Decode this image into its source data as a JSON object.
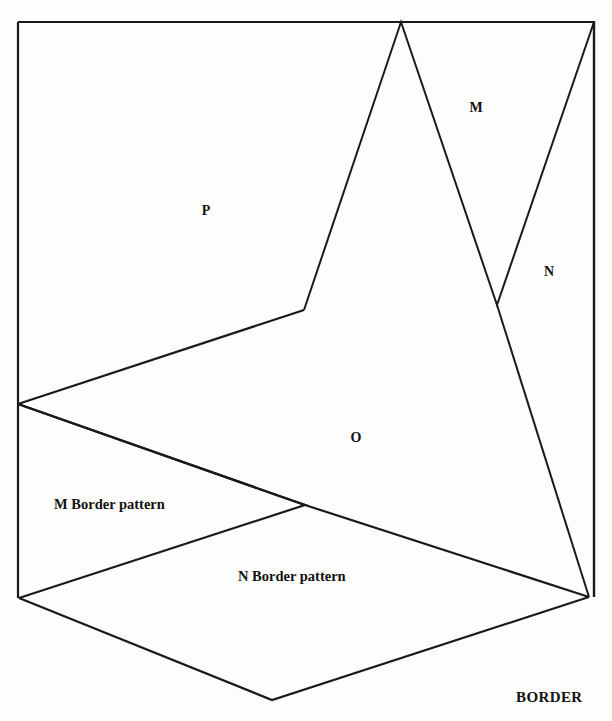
{
  "figure": {
    "background_color": "#fdfdfc",
    "stroke_color": "#1a1a1a",
    "text_color": "#111111"
  },
  "region_labels": [
    {
      "id": "p",
      "text": "P",
      "x": 206,
      "y": 215
    },
    {
      "id": "m_top",
      "text": "M",
      "x": 476,
      "y": 112
    },
    {
      "id": "n_right",
      "text": "N",
      "x": 549,
      "y": 276
    },
    {
      "id": "o_center",
      "text": "O",
      "x": 356,
      "y": 442
    }
  ],
  "captions": [
    {
      "id": "m-border-pattern",
      "text": "M   Border pattern",
      "x": 54,
      "y": 509
    },
    {
      "id": "n-border-pattern",
      "text": "N   Border pattern",
      "x": 238,
      "y": 581
    }
  ],
  "corner_label": {
    "id": "border",
    "text": "BORDER",
    "x": 516,
    "y": 702
  },
  "geometry": {
    "outer_frame": "M18,22 L594,22 L594,597",
    "left_edge": "M18,22 L18,598",
    "right_edge": "M594,22 L594,597",
    "zigzag_m": "M304,310 L401,22 L497,305 L594,22",
    "descender": "M497,305 L589,597",
    "p_lower_edge": "M18,404 L304,310",
    "o_region_left": "M18,404 L305,505 L589,597",
    "o_lower_edge": "M589,597 L305,505",
    "m_pattern_wedge": "M18,404 L305,505 L19,598",
    "n_pattern_lower": "M19,598 L272,700 L589,597",
    "bottom_left_stub": "M18,598 L19,598"
  },
  "vertices": [
    {
      "name": "top-left",
      "x": 18,
      "y": 22
    },
    {
      "name": "top-apex",
      "x": 401,
      "y": 22
    },
    {
      "name": "top-right",
      "x": 594,
      "y": 22
    },
    {
      "name": "bend-p",
      "x": 304,
      "y": 310
    },
    {
      "name": "v-notch",
      "x": 497,
      "y": 305
    },
    {
      "name": "left-mid",
      "x": 18,
      "y": 404
    },
    {
      "name": "cross-mid",
      "x": 305,
      "y": 505
    },
    {
      "name": "bottom-left",
      "x": 19,
      "y": 598
    },
    {
      "name": "right-converge",
      "x": 589,
      "y": 597
    },
    {
      "name": "bottom-apex",
      "x": 272,
      "y": 700
    }
  ]
}
